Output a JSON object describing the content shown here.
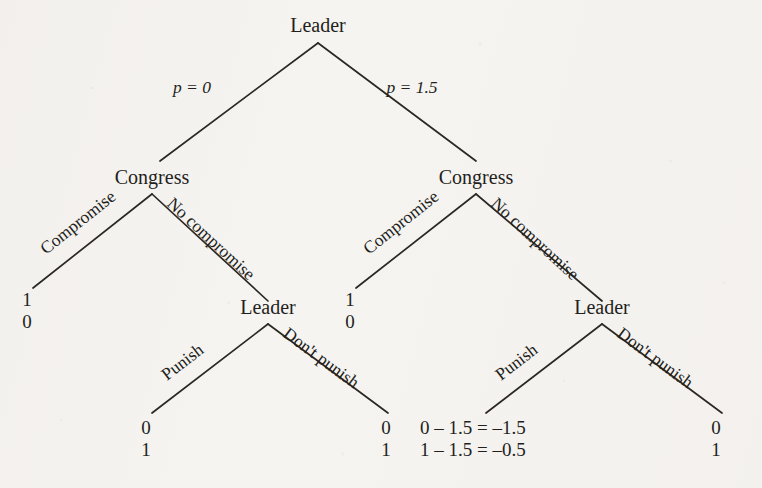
{
  "figure": {
    "type": "extensive-form-game-tree",
    "background_color": "#f6f4f1",
    "ink_color": "#231f1c"
  },
  "nodes": {
    "root": {
      "label": "Leader",
      "player": "Leader"
    },
    "congress_left": {
      "label": "Congress",
      "player": "Congress"
    },
    "congress_right": {
      "label": "Congress",
      "player": "Congress"
    },
    "leader_left": {
      "label": "Leader",
      "player": "Leader"
    },
    "leader_right": {
      "label": "Leader",
      "player": "Leader"
    }
  },
  "branch_labels": {
    "root_left": "p = 0",
    "root_right": "p = 1.5",
    "congress_left_left": "Compromise",
    "congress_left_right": "No compromise",
    "congress_right_left": "Compromise",
    "congress_right_right": "No compromise",
    "leader_left_left": "Punish",
    "leader_left_right": "Don't punish",
    "leader_right_left": "Punish",
    "leader_right_right": "Don't punish"
  },
  "payoffs": [
    {
      "id": "payoff-1",
      "top": "1",
      "bottom": "0"
    },
    {
      "id": "payoff-2",
      "top": "0",
      "bottom": "1"
    },
    {
      "id": "payoff-3",
      "top": "0",
      "bottom": "1"
    },
    {
      "id": "payoff-4",
      "top": "1",
      "bottom": "0"
    },
    {
      "id": "payoff-5",
      "top": "0 – 1.5 = –1.5",
      "bottom": "1 – 1.5 = –0.5"
    },
    {
      "id": "payoff-6",
      "top": "0",
      "bottom": "1"
    }
  ]
}
